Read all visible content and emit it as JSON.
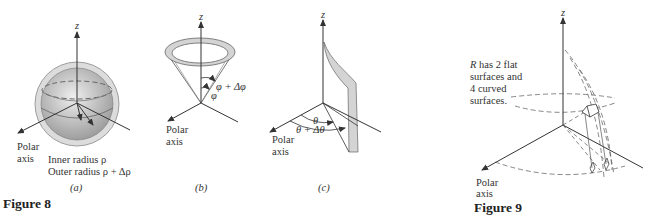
{
  "figure8": {
    "caption": "Figure 8",
    "panels": {
      "a": {
        "sublabel": "(a)",
        "z_label": "z",
        "polar_axis_line1": "Polar",
        "polar_axis_line2": "axis",
        "inner_radius": "Inner radius ρ",
        "outer_radius": "Outer radius ρ + Δρ"
      },
      "b": {
        "sublabel": "(b)",
        "z_label": "z",
        "polar_axis_line1": "Polar",
        "polar_axis_line2": "axis",
        "phi_label": "φ",
        "phi_delta_label": "φ + Δφ"
      },
      "c": {
        "sublabel": "(c)",
        "z_label": "z",
        "polar_axis_line1": "Polar",
        "polar_axis_line2": "axis",
        "theta_label": "θ",
        "theta_delta_label": "θ + Δθ"
      }
    }
  },
  "figure9": {
    "caption": "Figure 9",
    "z_label": "z",
    "polar_axis_line1": "Polar",
    "polar_axis_line2": "axis",
    "note_lines": [
      "R has 2 flat",
      "surfaces and",
      "4 curved",
      "surfaces."
    ]
  },
  "colors": {
    "ink": "#333333",
    "shell_outer": "#d9d9d9",
    "shell_inner": "#bdbdbd",
    "wedge_fill": "#d4d4d4"
  }
}
